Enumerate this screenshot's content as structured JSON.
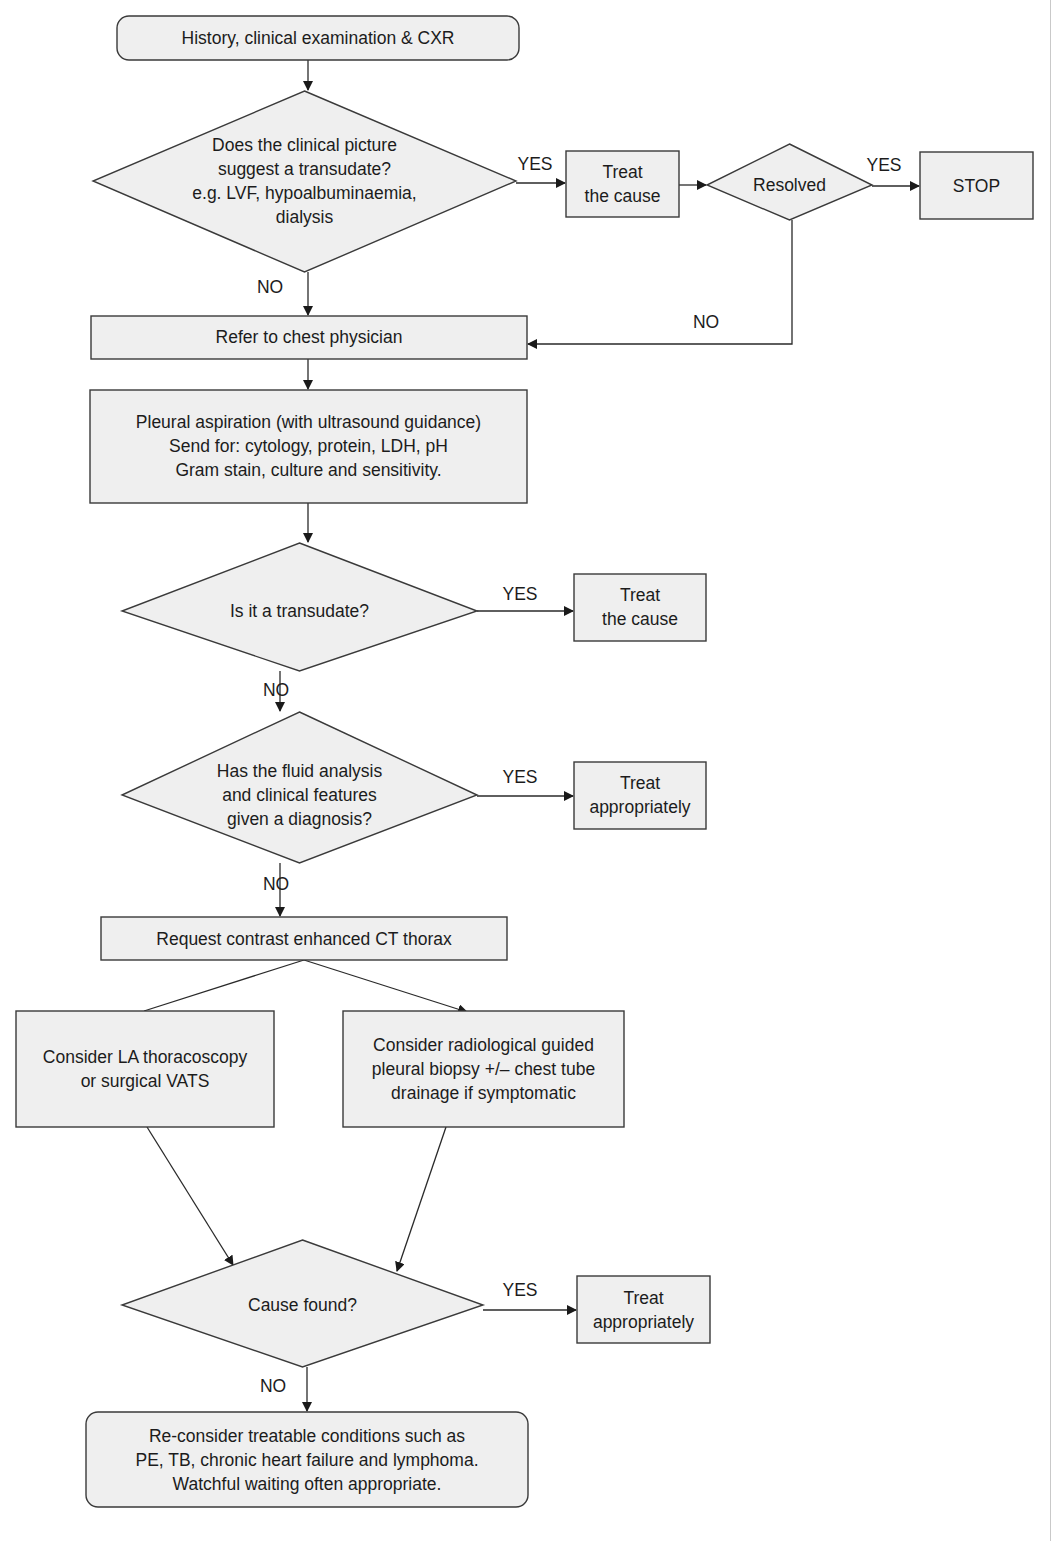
{
  "flowchart": {
    "nodes": {
      "start": {
        "type": "rounded-box",
        "lines": [
          "History, clinical examination & CXR"
        ]
      },
      "q_transudate_clinical": {
        "type": "diamond",
        "lines": [
          "Does the clinical picture",
          "suggest a transudate?",
          "e.g. LVF, hypoalbuminaemia,",
          "dialysis"
        ]
      },
      "treat_cause_1": {
        "type": "box",
        "lines": [
          "Treat",
          "the cause"
        ]
      },
      "resolved": {
        "type": "diamond",
        "lines": [
          "Resolved"
        ]
      },
      "stop": {
        "type": "box",
        "lines": [
          "STOP"
        ]
      },
      "refer": {
        "type": "box",
        "lines": [
          "Refer to chest physician"
        ]
      },
      "aspiration": {
        "type": "box",
        "lines": [
          "Pleural aspiration (with ultrasound guidance)",
          "Send for: cytology, protein, LDH, pH",
          "Gram stain, culture and sensitivity."
        ]
      },
      "q_is_transudate": {
        "type": "diamond",
        "lines": [
          "Is it a transudate?"
        ]
      },
      "treat_cause_2": {
        "type": "box",
        "lines": [
          "Treat",
          "the cause"
        ]
      },
      "q_diagnosis": {
        "type": "diamond",
        "lines": [
          "Has the fluid analysis",
          "and clinical features",
          "given a diagnosis?"
        ]
      },
      "treat_appropriately_1": {
        "type": "box",
        "lines": [
          "Treat",
          "appropriately"
        ]
      },
      "ct": {
        "type": "box",
        "lines": [
          "Request contrast enhanced CT thorax"
        ]
      },
      "thoracoscopy": {
        "type": "box",
        "lines": [
          "Consider LA thoracoscopy",
          "or surgical VATS"
        ]
      },
      "biopsy": {
        "type": "box",
        "lines": [
          "Consider radiological guided",
          "pleural biopsy +/– chest tube",
          "drainage if symptomatic"
        ]
      },
      "q_cause_found": {
        "type": "diamond",
        "lines": [
          "Cause found?"
        ]
      },
      "treat_appropriately_2": {
        "type": "box",
        "lines": [
          "Treat",
          "appropriately"
        ]
      },
      "reconsider": {
        "type": "rounded-box",
        "lines": [
          "Re-consider treatable conditions such as",
          "PE, TB, chronic heart failure and lymphoma.",
          "Watchful waiting often appropriate."
        ]
      }
    },
    "edges": [
      {
        "from": "start",
        "to": "q_transudate_clinical",
        "label": ""
      },
      {
        "from": "q_transudate_clinical",
        "to": "treat_cause_1",
        "label": "YES"
      },
      {
        "from": "treat_cause_1",
        "to": "resolved",
        "label": ""
      },
      {
        "from": "resolved",
        "to": "stop",
        "label": "YES"
      },
      {
        "from": "resolved",
        "to": "refer",
        "label": "NO"
      },
      {
        "from": "q_transudate_clinical",
        "to": "refer",
        "label": "NO"
      },
      {
        "from": "refer",
        "to": "aspiration",
        "label": ""
      },
      {
        "from": "aspiration",
        "to": "q_is_transudate",
        "label": ""
      },
      {
        "from": "q_is_transudate",
        "to": "treat_cause_2",
        "label": "YES"
      },
      {
        "from": "q_is_transudate",
        "to": "q_diagnosis",
        "label": "NO"
      },
      {
        "from": "q_diagnosis",
        "to": "treat_appropriately_1",
        "label": "YES"
      },
      {
        "from": "q_diagnosis",
        "to": "ct",
        "label": "NO"
      },
      {
        "from": "ct",
        "to": "thoracoscopy",
        "label": ""
      },
      {
        "from": "ct",
        "to": "biopsy",
        "label": ""
      },
      {
        "from": "thoracoscopy",
        "to": "q_cause_found",
        "label": ""
      },
      {
        "from": "biopsy",
        "to": "q_cause_found",
        "label": ""
      },
      {
        "from": "q_cause_found",
        "to": "treat_appropriately_2",
        "label": "YES"
      },
      {
        "from": "q_cause_found",
        "to": "reconsider",
        "label": "NO"
      }
    ]
  },
  "colors": {
    "shape_fill": "#efefef",
    "stroke": "#3a3a3a",
    "text": "#1c1c1c"
  }
}
